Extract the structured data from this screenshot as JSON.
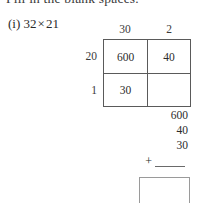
{
  "page": {
    "instruction": "Fill in the blank spaces.",
    "problem_label": "(i)",
    "factor_a": "32",
    "times_symbol": "×",
    "factor_b": "21"
  },
  "area_model": {
    "column_headers": [
      "30",
      "2"
    ],
    "row_labels": [
      "20",
      "1"
    ],
    "cells": [
      [
        "600",
        "40"
      ],
      [
        "30",
        ""
      ]
    ]
  },
  "addition": {
    "addends": [
      "600",
      "40",
      "30"
    ],
    "plus_sign": "+",
    "blank_answer": ""
  },
  "answer_box": {
    "value": ""
  },
  "colors": {
    "ink": "#2b2b2b",
    "grid_line": "#5a5a5a",
    "box_line": "#9a9a9a",
    "background": "#ffffff"
  }
}
